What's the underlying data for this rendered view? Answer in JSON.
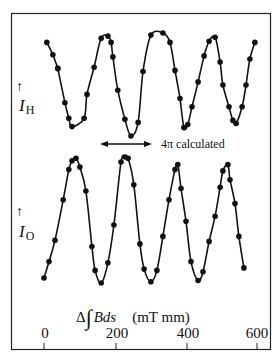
{
  "figure": {
    "upper_label_base": "I",
    "upper_label_sub": "H",
    "lower_label_base": "I",
    "lower_label_sub": "O",
    "arrow_symbol": "↑",
    "annotation": "4π calculated",
    "xlabel_delta": "Δ",
    "xlabel_integral": "∫",
    "xlabel_expr": "Bds",
    "xlabel_units": "(mT mm)",
    "x_ticks": [
      "0",
      "200",
      "400",
      "600"
    ]
  },
  "chart_data": {
    "type": "line",
    "title": "",
    "xlabel": "Δ∫Bds (mT mm)",
    "ylabel": "",
    "xlim": [
      0,
      600
    ],
    "x_ticks": [
      0,
      200,
      400,
      600
    ],
    "grid": false,
    "legend": null,
    "annotations": [
      {
        "text": "4π calculated",
        "type": "double-arrow",
        "x_start": 158,
        "x_end": 304,
        "panel": "between"
      }
    ],
    "series": [
      {
        "name": "I_H",
        "panel": "upper",
        "style": "markers + fitted curve",
        "y_units": "relative intensity (normalized)",
        "x": [
          8,
          25,
          39,
          39,
          59,
          70,
          79,
          113,
          121,
          141,
          161,
          180,
          189,
          194,
          208,
          228,
          245,
          265,
          279,
          301,
          335,
          355,
          369,
          383,
          394,
          405,
          417,
          434,
          451,
          465,
          482,
          496,
          504,
          521,
          532,
          541,
          558,
          569,
          580,
          594
        ],
        "y": [
          0.91,
          0.79,
          0.66,
          0.66,
          0.33,
          0.18,
          0.1,
          0.18,
          0.41,
          0.67,
          0.95,
          0.97,
          0.91,
          0.77,
          0.45,
          0.17,
          0.01,
          0.14,
          0.63,
          0.98,
          1.0,
          0.91,
          0.64,
          0.37,
          0.09,
          0.12,
          0.29,
          0.53,
          0.78,
          0.92,
          0.96,
          0.72,
          0.5,
          0.29,
          0.16,
          0.13,
          0.29,
          0.5,
          0.75,
          0.91
        ]
      },
      {
        "name": "I_O",
        "panel": "lower",
        "style": "markers + fitted curve",
        "y_units": "relative intensity (normalized)",
        "x": [
          0,
          14,
          31,
          54,
          70,
          79,
          90,
          101,
          118,
          135,
          144,
          161,
          180,
          197,
          217,
          228,
          237,
          253,
          270,
          282,
          301,
          318,
          335,
          352,
          369,
          377,
          386,
          400,
          414,
          434,
          448,
          465,
          482,
          496,
          504,
          518,
          524,
          538,
          549,
          563
        ],
        "y": [
          0.04,
          0.17,
          0.34,
          0.66,
          0.9,
          0.97,
          0.99,
          0.92,
          0.73,
          0.29,
          0.1,
          0.0,
          0.16,
          0.46,
          0.96,
          1.0,
          0.99,
          0.78,
          0.31,
          0.11,
          0.01,
          0.1,
          0.37,
          0.66,
          0.9,
          0.94,
          0.75,
          0.49,
          0.17,
          0.02,
          0.09,
          0.33,
          0.53,
          0.76,
          0.89,
          0.94,
          0.82,
          0.63,
          0.37,
          0.12
        ]
      }
    ]
  }
}
